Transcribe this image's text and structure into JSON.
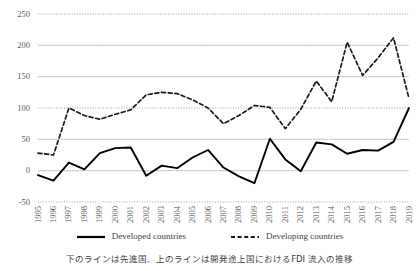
{
  "caption": "下のラインは先進国、上のラインは開発途上国におけるFDI 流入の推移",
  "legend": {
    "position": "bottom",
    "items": [
      {
        "label": "Developed countries",
        "style": "solid",
        "color": "#000000"
      },
      {
        "label": "Developing countries",
        "style": "dashed",
        "color": "#1a1a1a"
      }
    ]
  },
  "axis": {
    "y_ticks": [
      "250",
      "200",
      "150",
      "100",
      "50",
      "0",
      "-50"
    ],
    "x_ticks": [
      "1995",
      "1996",
      "1997",
      "1998",
      "1999",
      "2000",
      "2001",
      "2002",
      "2003",
      "2004",
      "2005",
      "2006",
      "2007",
      "2008",
      "2009",
      "2010",
      "2011",
      "2012",
      "2013",
      "2014",
      "2015",
      "2016",
      "2017",
      "2018",
      "2019"
    ]
  },
  "chart_data": {
    "type": "line",
    "title": "",
    "xlabel": "",
    "ylabel": "",
    "ylim": [
      -50,
      250
    ],
    "ytick_step": 50,
    "grid": true,
    "legend_position": "bottom",
    "annotation": "下のラインは先進国、上のラインは開発途上国におけるFDI 流入の推移",
    "categories": [
      "1995",
      "1996",
      "1997",
      "1998",
      "1999",
      "2000",
      "2001",
      "2002",
      "2003",
      "2004",
      "2005",
      "2006",
      "2007",
      "2008",
      "2009",
      "2010",
      "2011",
      "2012",
      "2013",
      "2014",
      "2015",
      "2016",
      "2017",
      "2018",
      "2019"
    ],
    "series": [
      {
        "name": "Developed countries",
        "style": "solid",
        "color": "#000000",
        "values": [
          -7,
          -16,
          13,
          2,
          28,
          36,
          37,
          -8,
          8,
          4,
          21,
          33,
          5,
          -9,
          -20,
          51,
          18,
          -1,
          45,
          42,
          27,
          33,
          32,
          46,
          100
        ]
      },
      {
        "name": "Developing countries",
        "style": "dashed",
        "color": "#1a1a1a",
        "values": [
          28,
          25,
          100,
          88,
          82,
          90,
          97,
          121,
          125,
          123,
          113,
          100,
          75,
          88,
          104,
          101,
          67,
          98,
          143,
          110,
          205,
          152,
          180,
          212,
          115
        ]
      }
    ]
  }
}
